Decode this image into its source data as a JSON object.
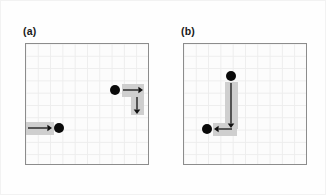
{
  "figure": {
    "type": "diagram",
    "background_color": "#fefefe",
    "grid": {
      "rows": 10,
      "cols": 10,
      "cell_px": 12.3,
      "line_color": "#ededed",
      "border_color": "#8c8c8c",
      "fill_color": "#fcfcfc"
    },
    "colors": {
      "dot": "#0a0a0a",
      "arrow": "#111111",
      "track_shade": "#cfcfcf",
      "label": "#1a1a1a"
    }
  },
  "panels": [
    {
      "id": "panel-a",
      "label": "(a)",
      "label_x": 22,
      "label_y": 24,
      "box": {
        "x": 24,
        "y": 42,
        "w": 124,
        "h": 122
      },
      "dots": [
        {
          "name": "dot-lower-left",
          "cx": 57,
          "cy": 126,
          "r": 5.0
        },
        {
          "name": "dot-upper-right",
          "cx": 113,
          "cy": 88,
          "r": 5.0
        }
      ],
      "tracks": [
        {
          "name": "track-lower-horizontal",
          "x": 24,
          "y": 120,
          "w": 28,
          "h": 12.5
        },
        {
          "name": "track-upper-horizontal",
          "x": 120,
          "y": 82,
          "w": 22,
          "h": 12.5
        },
        {
          "name": "track-upper-vertical",
          "x": 129,
          "y": 94,
          "w": 12.5,
          "h": 19
        }
      ],
      "arrows": [
        {
          "name": "arrow-right-lower",
          "dir": "right",
          "x1": 26,
          "y1": 126,
          "x2": 50,
          "y2": 126
        },
        {
          "name": "arrow-right-upper",
          "dir": "right",
          "x1": 121,
          "y1": 88,
          "x2": 141,
          "y2": 88
        },
        {
          "name": "arrow-down-upper",
          "dir": "down",
          "x1": 135,
          "y1": 95,
          "x2": 135,
          "y2": 112
        }
      ]
    },
    {
      "id": "panel-b",
      "label": "(b)",
      "label_x": 180,
      "label_y": 24,
      "box": {
        "x": 182,
        "y": 42,
        "w": 124,
        "h": 122
      },
      "dots": [
        {
          "name": "dot-top",
          "cx": 229,
          "cy": 74,
          "r": 5.0
        },
        {
          "name": "dot-lower-left",
          "cx": 205,
          "cy": 127,
          "r": 5.0
        }
      ],
      "tracks": [
        {
          "name": "track-vertical",
          "x": 223,
          "y": 80,
          "w": 12.5,
          "h": 47
        },
        {
          "name": "track-horizontal",
          "x": 211,
          "y": 121,
          "w": 24,
          "h": 12.5
        }
      ],
      "arrows": [
        {
          "name": "arrow-down",
          "dir": "down",
          "x1": 229,
          "y1": 81,
          "x2": 229,
          "y2": 126
        },
        {
          "name": "arrow-left",
          "dir": "left",
          "x1": 230,
          "y1": 127,
          "x2": 212,
          "y2": 127
        }
      ]
    }
  ]
}
